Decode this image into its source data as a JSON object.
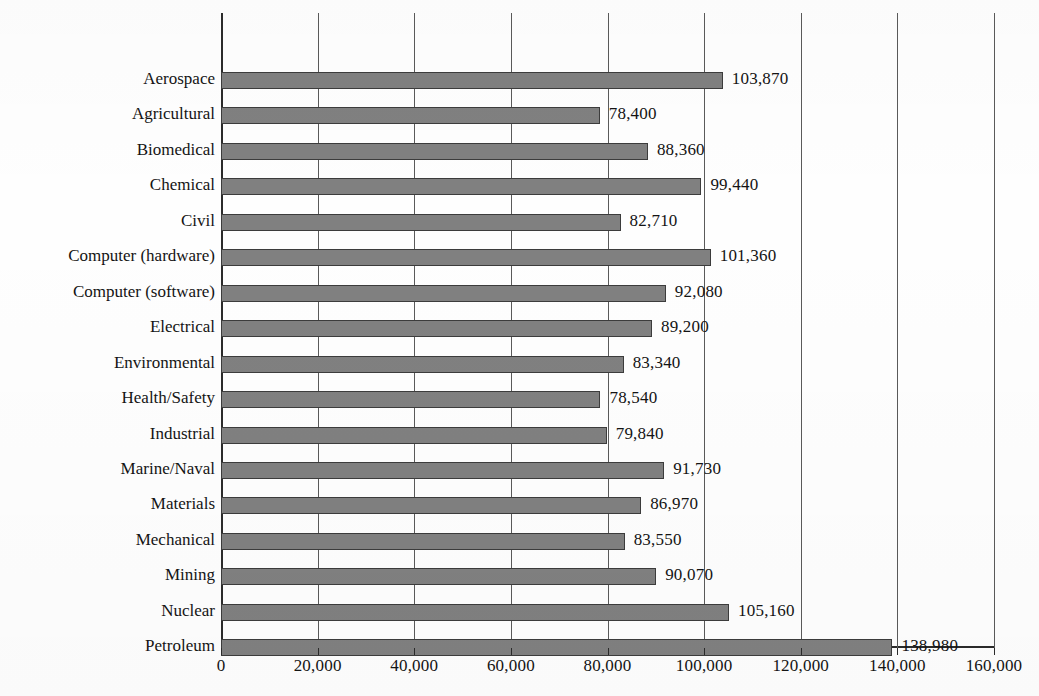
{
  "chart_data": {
    "type": "bar",
    "orientation": "horizontal",
    "title": "",
    "subtitle": "",
    "xlabel": "",
    "ylabel": "",
    "xlim": [
      0,
      160000
    ],
    "xticks": [
      0,
      20000,
      40000,
      60000,
      80000,
      100000,
      120000,
      140000,
      160000
    ],
    "xtick_labels": [
      "0",
      "20,000",
      "40,000",
      "60,000",
      "80,000",
      "100,000",
      "120,000",
      "140,000",
      "160,000"
    ],
    "grid": true,
    "grid_axis": "x",
    "legend": false,
    "legend_position": "none",
    "bar_color": "#808080",
    "bar_edge_color": "#3c3c3c",
    "categories": [
      "Aerospace",
      "Agricultural",
      "Biomedical",
      "Chemical",
      "Civil",
      "Computer (hardware)",
      "Computer (software)",
      "Electrical",
      "Environmental",
      "Health/Safety",
      "Industrial",
      "Marine/Naval",
      "Materials",
      "Mechanical",
      "Mining",
      "Nuclear",
      "Petroleum"
    ],
    "values": [
      103870,
      78400,
      88360,
      99440,
      82710,
      101360,
      92080,
      89200,
      83340,
      78540,
      79840,
      91730,
      86970,
      83550,
      90070,
      105160,
      138980
    ],
    "value_labels": [
      "103,870",
      "78,400",
      "88,360",
      "99,440",
      "82,710",
      "101,360",
      "92,080",
      "89,200",
      "83,340",
      "78,540",
      "79,840",
      "91,730",
      "86,970",
      "83,550",
      "90,070",
      "105,160",
      "138,980"
    ]
  }
}
